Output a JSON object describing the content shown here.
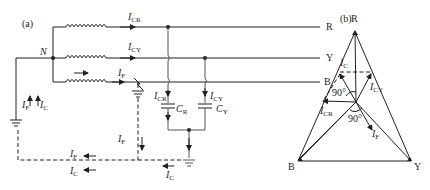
{
  "panel_a": {
    "label": "(a)",
    "neutral": "N",
    "lines": {
      "r": "R",
      "y": "Y",
      "b": "B"
    },
    "currents": {
      "i_cr": {
        "main": "I",
        "sub": "CR"
      },
      "i_cy": {
        "main": "I",
        "sub": "CY"
      },
      "i_f": {
        "main": "I",
        "sub": "F"
      },
      "i_c": {
        "main": "I",
        "sub": "C"
      }
    },
    "capacitors": {
      "c_r": {
        "main": "C",
        "sub": "R"
      },
      "c_y": {
        "main": "C",
        "sub": "Y"
      }
    }
  },
  "panel_b": {
    "label": "(b)",
    "vertices": {
      "r": "R",
      "y": "Y",
      "b": "B"
    },
    "phasors": {
      "i_c": {
        "main": "I",
        "sub": "C"
      },
      "i_cy": {
        "main": "I",
        "sub": "CY"
      },
      "i_cr": {
        "main": "I",
        "sub": "CR"
      },
      "i_f": {
        "main": "I",
        "sub": "F"
      }
    },
    "angles": {
      "upper": "90°",
      "lower": "90°"
    }
  }
}
